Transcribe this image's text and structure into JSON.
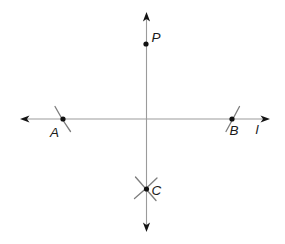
{
  "diagram": {
    "background_color": "#ffffff",
    "line_color": "#9b9b9b",
    "mark_color": "#7d7d7d",
    "ink_color": "#141414",
    "labels": {
      "p": "P",
      "a": "A",
      "b": "B",
      "c": "C",
      "line": "l"
    }
  }
}
